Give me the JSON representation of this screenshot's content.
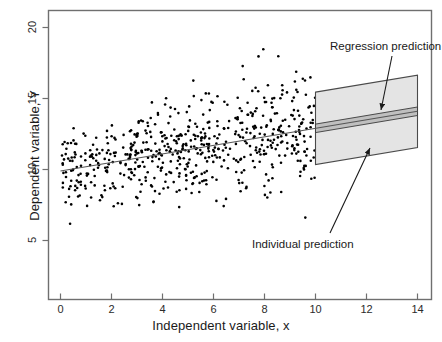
{
  "chart_data": {
    "type": "scatter",
    "title": "",
    "subtitle": "",
    "xlabel": "Independent variable, x",
    "ylabel": "Dependent variable, Y",
    "xlim": [
      -0.5,
      14.6
    ],
    "ylim": [
      3.6,
      20.8
    ],
    "xticks": [
      0,
      2,
      4,
      6,
      8,
      10,
      12,
      14
    ],
    "xticklabels": [
      "0",
      "2",
      "4",
      "6",
      "8",
      "10",
      "12",
      "14"
    ],
    "yticks": [
      5,
      10,
      15,
      20
    ],
    "yticklabels": [
      "5",
      "10",
      "15",
      "20"
    ],
    "grid": false,
    "legend": null,
    "point_color": "#000000",
    "point_marker": "filled-circle",
    "point_size_px": 2.6,
    "n_points": 620,
    "x_range_data": [
      0.05,
      10.0
    ],
    "series": [
      {
        "name": "observations",
        "description": "Scatter of Y against x with increasing spread",
        "x_min": 0.05,
        "x_max": 10.0,
        "y_min": 4.8,
        "y_max": 18.8
      }
    ],
    "fit_line": {
      "name": "Least-squares regression line",
      "intercept": 9.9,
      "slope": 0.3,
      "x_start": 0.0,
      "x_end": 14.0,
      "color": "#555555"
    },
    "bands": [
      {
        "name": "Individual prediction",
        "kind": "prediction-interval",
        "x_start": 10.0,
        "x_end": 14.0,
        "half_width": 2.55,
        "fill": "#e3e3e3",
        "edge": "#4a4a4a"
      },
      {
        "name": "Regression prediction",
        "kind": "confidence-interval",
        "x_start": 10.0,
        "x_end": 14.0,
        "half_width": 0.3,
        "fill": "#bdbdbd",
        "edge": "#3a3a3a"
      }
    ],
    "annotations": [
      {
        "text": "Regression prediction",
        "label_x_px": 330,
        "label_y_px": 40,
        "arrow_from_px": [
          392,
          56
        ],
        "arrow_to_px": [
          381,
          111
        ]
      },
      {
        "text": "Individual prediction",
        "label_x_px": 252,
        "label_y_px": 238,
        "arrow_from_px": [
          330,
          234
        ],
        "arrow_to_px": [
          370,
          147
        ]
      }
    ]
  },
  "axes": {
    "x_title": "Independent variable, x",
    "y_title": "Dependent variable, Y",
    "x_tick_labels": [
      "0",
      "2",
      "4",
      "6",
      "8",
      "10",
      "12",
      "14"
    ],
    "y_tick_labels": [
      "5",
      "10",
      "15",
      "20"
    ]
  },
  "annotations": {
    "regression": "Regression prediction",
    "individual": "Individual prediction"
  },
  "colors": {
    "point": "#000000",
    "frame": "#6f6f6f",
    "fit_line": "#555555",
    "band_outer_fill": "#e3e3e3",
    "band_inner_fill": "#bdbdbd",
    "band_edge": "#4a4a4a",
    "text": "#1a1a1a"
  }
}
